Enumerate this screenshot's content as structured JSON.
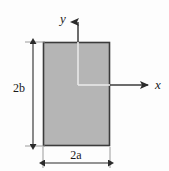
{
  "figure": {
    "name": "rectangular-cross-section",
    "background_color": "#fdfdfd",
    "shape": {
      "type": "rectangle",
      "fill_color": "#b5b5b5",
      "stroke_color": "#3b3b3b",
      "x": 43,
      "y": 42,
      "width": 67,
      "height": 104
    },
    "axes": {
      "origin": {
        "x": 78,
        "y": 85
      },
      "stroke_color": "#3b3b3b",
      "overlap_color": "#e9e9e9",
      "y_axis": {
        "label": "y",
        "label_x": 63,
        "label_y": 23,
        "tip_x": 78,
        "tip_y": 16
      },
      "x_axis": {
        "label": "x",
        "label_x": 155,
        "label_y": 89,
        "tip_x": 152,
        "tip_y": 85
      }
    },
    "dimensions": [
      {
        "name": "height-dimension",
        "label": "2b",
        "orientation": "vertical",
        "label_x": 13,
        "label_y": 92,
        "line_x": 33,
        "start": 42,
        "end": 146,
        "witness_color": "#808080"
      },
      {
        "name": "width-dimension",
        "label": "2a",
        "orientation": "horizontal",
        "label_x": 68,
        "label_y": 160,
        "line_y": 163,
        "start": 43,
        "end": 110,
        "witness_color": "#808080"
      }
    ]
  }
}
